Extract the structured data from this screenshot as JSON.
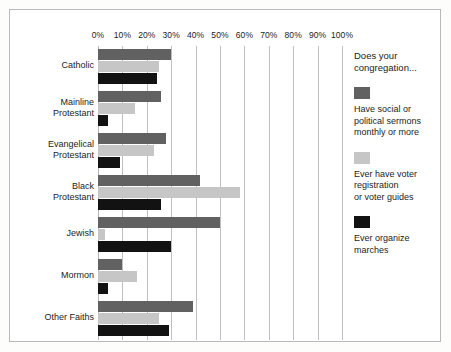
{
  "chart_data": {
    "type": "bar",
    "orientation": "horizontal",
    "title": "",
    "xlabel": "",
    "ylabel": "",
    "xlim": [
      0,
      100
    ],
    "xtick_labels": [
      "0%",
      "10%",
      "20%",
      "30%",
      "40%",
      "50%",
      "60%",
      "70%",
      "80%",
      "90%",
      "100%"
    ],
    "xtick_values": [
      0,
      10,
      20,
      30,
      40,
      50,
      60,
      70,
      80,
      90,
      100
    ],
    "grid": "vertical",
    "legend_position": "right",
    "legend_title": "Does your congregation...",
    "categories": [
      "Catholic",
      "Mainline\nProtestant",
      "Evangelical\nProtestant",
      "Black\nProtestant",
      "Jewish",
      "Mormon",
      "Other Faiths"
    ],
    "series": [
      {
        "name": "Have social or\npolitical sermons\nmonthly or more",
        "color": "#616161",
        "values": [
          30,
          26,
          28,
          42,
          50,
          10,
          39
        ]
      },
      {
        "name": "Ever have voter\nregistration\nor voter guides",
        "color": "#c6c6c6",
        "values": [
          25,
          15,
          23,
          58,
          3,
          16,
          25
        ]
      },
      {
        "name": "Ever organize\nmarches",
        "color": "#121212",
        "values": [
          24,
          4,
          9,
          26,
          30,
          4,
          29
        ]
      }
    ]
  }
}
